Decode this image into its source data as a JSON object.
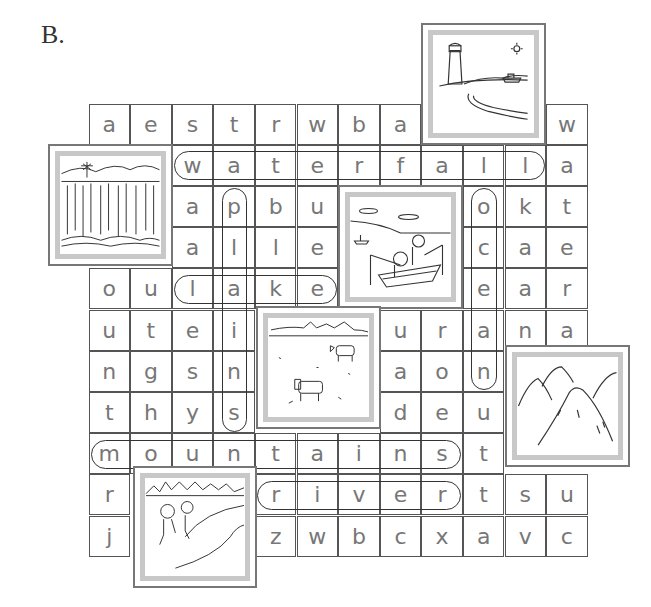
{
  "section_label": "B.",
  "grid": {
    "left": 89,
    "top": 104,
    "cell_w": 41.6,
    "cell_h": 41.2,
    "rows": [
      [
        "a",
        "e",
        "s",
        "t",
        "r",
        "w",
        "b",
        "a",
        null,
        null,
        null,
        "w"
      ],
      [
        null,
        null,
        "w",
        "a",
        "t",
        "e",
        "r",
        "f",
        "a",
        "l",
        "l",
        "a"
      ],
      [
        null,
        null,
        "a",
        "p",
        "b",
        "u",
        null,
        null,
        null,
        "o",
        "k",
        "t"
      ],
      [
        null,
        null,
        "a",
        "l",
        "l",
        "e",
        null,
        null,
        null,
        "c",
        "a",
        "e"
      ],
      [
        "o",
        "u",
        "l",
        "a",
        "k",
        "e",
        null,
        null,
        null,
        "e",
        "a",
        "r"
      ],
      [
        "u",
        "t",
        "e",
        "i",
        null,
        null,
        null,
        "u",
        "r",
        "a",
        "n",
        "a"
      ],
      [
        "n",
        "g",
        "s",
        "n",
        null,
        null,
        null,
        "a",
        "o",
        "n",
        null,
        null
      ],
      [
        "t",
        "h",
        "y",
        "s",
        null,
        null,
        null,
        "d",
        "e",
        "u",
        null,
        null
      ],
      [
        "m",
        "o",
        "u",
        "n",
        "t",
        "a",
        "i",
        "n",
        "s",
        "t",
        null,
        null
      ],
      [
        "r",
        null,
        null,
        null,
        "r",
        "i",
        "v",
        "e",
        "r",
        "t",
        "s",
        "u"
      ],
      [
        "j",
        null,
        null,
        null,
        "z",
        "w",
        "b",
        "c",
        "x",
        "a",
        "v",
        "c"
      ]
    ]
  },
  "found_words": [
    {
      "word": "waterfall",
      "direction": "horizontal",
      "row": 1,
      "col_start": 2,
      "col_end": 10
    },
    {
      "word": "lake",
      "direction": "horizontal",
      "row": 4,
      "col_start": 2,
      "col_end": 5
    },
    {
      "word": "mountains",
      "direction": "horizontal",
      "row": 8,
      "col_start": 0,
      "col_end": 8
    },
    {
      "word": "river",
      "direction": "horizontal",
      "row": 9,
      "col_start": 4,
      "col_end": 8
    },
    {
      "word": "plains",
      "direction": "vertical",
      "col": 3,
      "row_start": 2,
      "row_end": 7
    },
    {
      "word": "ocean",
      "direction": "vertical",
      "col": 9,
      "row_start": 2,
      "row_end": 6
    }
  ],
  "pictures": [
    {
      "name": "lighthouse-sea-picture",
      "subject": "lighthouse and sea",
      "x": 421,
      "y": 23,
      "w": 125,
      "h": 122
    },
    {
      "name": "waterfall-picture",
      "subject": "waterfall",
      "x": 48,
      "y": 144,
      "w": 125,
      "h": 122
    },
    {
      "name": "fishing-boat-picture",
      "subject": "people fishing on a lake",
      "x": 338,
      "y": 185,
      "w": 125,
      "h": 124
    },
    {
      "name": "cows-plains-picture",
      "subject": "cows on plains",
      "x": 256,
      "y": 306,
      "w": 125,
      "h": 123
    },
    {
      "name": "mountains-picture",
      "subject": "mountains",
      "x": 505,
      "y": 345,
      "w": 125,
      "h": 122
    },
    {
      "name": "river-children-picture",
      "subject": "children by a river",
      "x": 133,
      "y": 466,
      "w": 124,
      "h": 122
    }
  ],
  "colors": {
    "letter": "#777777",
    "grid_line": "#555555",
    "picture_frame": "#c8c8c8",
    "oval": "#333333"
  }
}
